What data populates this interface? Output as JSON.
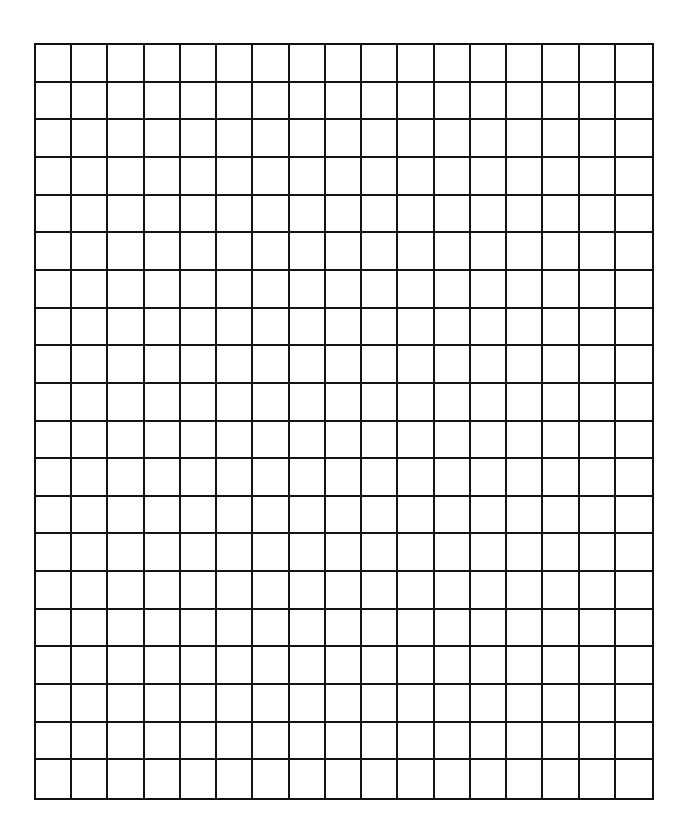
{
  "document": {
    "type": "graph-paper-worksheet",
    "grid": {
      "columns": 17,
      "rows": 20,
      "line_color": "#141414",
      "background_color": "#ffffff"
    }
  }
}
